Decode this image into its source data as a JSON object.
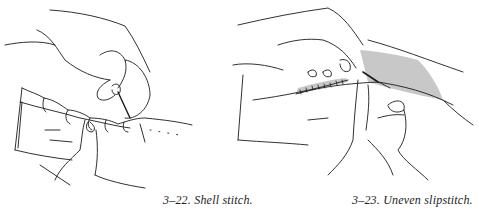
{
  "figures": [
    {
      "id": "3-22",
      "caption": "3–22. Shell stitch.",
      "illustration": "hands sewing a shell stitch along a folded fabric edge"
    },
    {
      "id": "3-23",
      "caption": "3–23. Uneven slipstitch.",
      "illustration": "hands sewing an uneven slipstitch on a shaded fabric hem"
    }
  ],
  "colors": {
    "ink": "#1a1a1a",
    "shading": "#c8c8c8",
    "background": "#ffffff"
  }
}
